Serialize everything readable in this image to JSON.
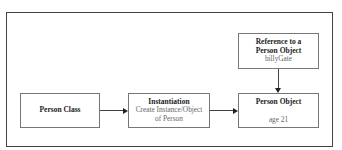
{
  "diagram": {
    "nodes": [
      {
        "id": "person-class",
        "title": "Person Class",
        "subtitle": ""
      },
      {
        "id": "instantiation",
        "title": "Instantiation",
        "subtitle_line1": "Create Instance/Object",
        "subtitle_line2": "of Person"
      },
      {
        "id": "person-object",
        "title": "Person Object",
        "subtitle": "age 21"
      },
      {
        "id": "reference",
        "title_line1": "Reference to a",
        "title_line2": "Person Object",
        "subtitle": "billyGate"
      }
    ],
    "edges": [
      {
        "from": "person-class",
        "to": "instantiation"
      },
      {
        "from": "instantiation",
        "to": "person-object"
      },
      {
        "from": "reference",
        "to": "person-object"
      }
    ]
  }
}
